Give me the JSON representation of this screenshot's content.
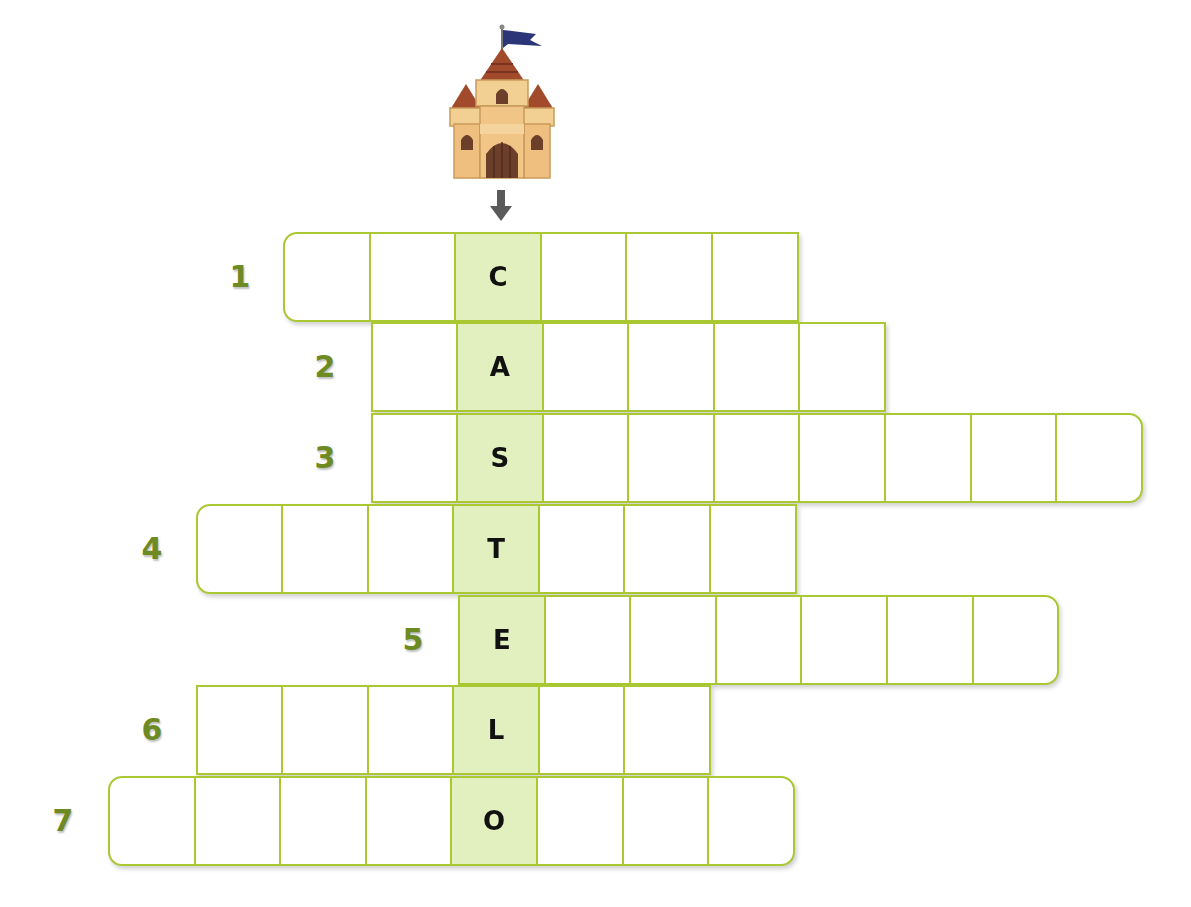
{
  "puzzle": {
    "keyword": "CASTELO",
    "image": "castle-icon",
    "arrow": "down-arrow-icon",
    "colors": {
      "grid_border": "#a9c832",
      "key_column_fill": "#e2efbf",
      "number_color": "#6d8a23",
      "letter_color": "#111111"
    },
    "rows": [
      {
        "number": "1",
        "start_col": 2,
        "length": 6,
        "key_index": 2,
        "letter": "C",
        "round_left": true,
        "round_right": false,
        "top": 232,
        "num_x": 220
      },
      {
        "number": "2",
        "start_col": 3,
        "length": 6,
        "key_index": 1,
        "letter": "A",
        "round_left": false,
        "round_right": false,
        "top": 322,
        "num_x": 305
      },
      {
        "number": "3",
        "start_col": 3,
        "length": 9,
        "key_index": 1,
        "letter": "S",
        "round_left": false,
        "round_right": true,
        "top": 413,
        "num_x": 305
      },
      {
        "number": "4",
        "start_col": 1,
        "length": 7,
        "key_index": 3,
        "letter": "T",
        "round_left": true,
        "round_right": false,
        "top": 504,
        "num_x": 132
      },
      {
        "number": "5",
        "start_col": 4,
        "length": 7,
        "key_index": 0,
        "letter": "E",
        "round_left": false,
        "round_right": true,
        "top": 595,
        "num_x": 393
      },
      {
        "number": "6",
        "start_col": 1,
        "length": 6,
        "key_index": 3,
        "letter": "L",
        "round_left": false,
        "round_right": false,
        "top": 685,
        "num_x": 132
      },
      {
        "number": "7",
        "start_col": 0,
        "length": 8,
        "key_index": 4,
        "letter": "O",
        "round_left": true,
        "round_right": true,
        "top": 776,
        "num_x": 43
      }
    ]
  }
}
